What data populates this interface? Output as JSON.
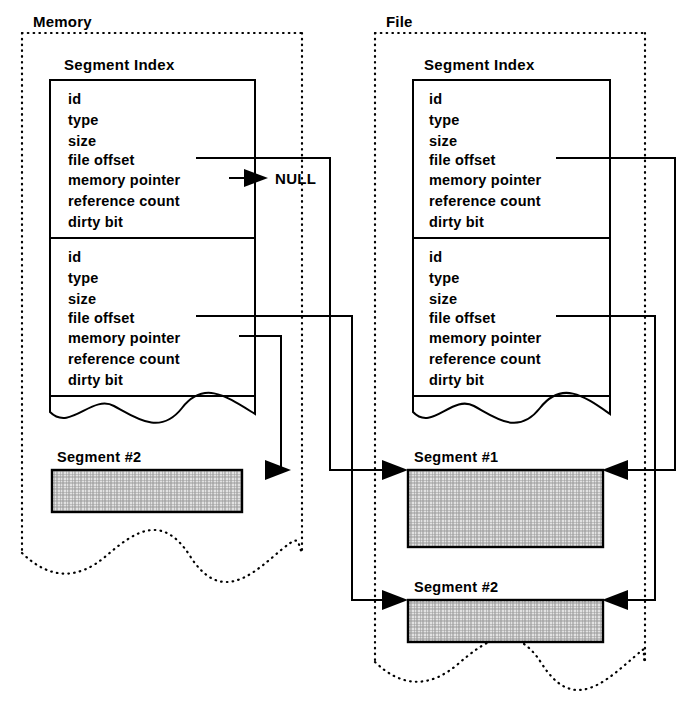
{
  "diagram": {
    "panels": [
      {
        "id": "memory",
        "label": "Memory",
        "index_title": "Segment Index",
        "records": [
          {
            "fields": [
              "id",
              "type",
              "size",
              "file offset",
              "memory pointer",
              "reference count",
              "dirty bit"
            ],
            "memory_pointer_value": "NULL"
          },
          {
            "fields": [
              "id",
              "type",
              "size",
              "file offset",
              "memory pointer",
              "reference count",
              "dirty bit"
            ]
          }
        ],
        "segments": [
          {
            "label": "Segment #2"
          }
        ]
      },
      {
        "id": "file",
        "label": "File",
        "index_title": "Segment Index",
        "records": [
          {
            "fields": [
              "id",
              "type",
              "size",
              "file offset",
              "memory pointer",
              "reference count",
              "dirty bit"
            ]
          },
          {
            "fields": [
              "id",
              "type",
              "size",
              "file offset",
              "memory pointer",
              "reference count",
              "dirty bit"
            ]
          }
        ],
        "segments": [
          {
            "label": "Segment #1"
          },
          {
            "label": "Segment #2"
          }
        ]
      }
    ],
    "annotations": {
      "null_label": "NULL"
    },
    "colors": {
      "stroke": "#000000",
      "background": "#ffffff",
      "segment_fill": "#c8c8c8"
    }
  }
}
